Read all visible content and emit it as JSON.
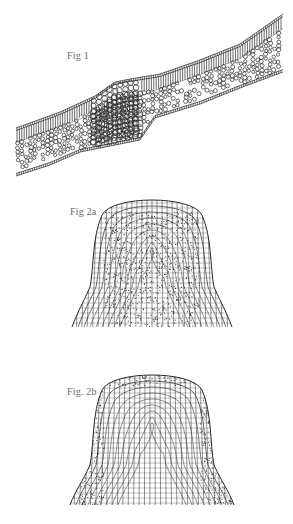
{
  "plate": {
    "background": "#ffffff",
    "ink_color": "#2a2a2a",
    "label_color": "#6a6a6a"
  },
  "figures": [
    {
      "id": "fig1",
      "label": "Fig 1",
      "subject": "leaf-cross-section",
      "description": "Oblique transverse section of a leaf blade with palisade layer above, spongy mesophyll of rounded cells below, and a thickened midrib region of larger cells"
    },
    {
      "id": "fig2a",
      "label": "Fig 2a",
      "subject": "shoot-apex",
      "description": "Dome-shaped apical meristem with a clear outer cell layer and densely stippled inner tissue"
    },
    {
      "id": "fig2b",
      "label": "Fig. 2b",
      "subject": "shoot-apex",
      "description": "Dome-shaped apex with a stippled outer tunica layers and clear elongated inner corpus cells in columns"
    }
  ]
}
